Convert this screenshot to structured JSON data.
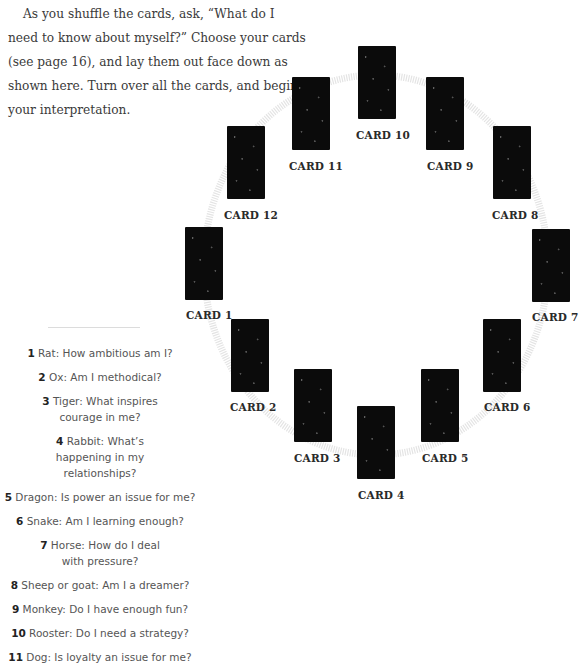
{
  "intro": {
    "text": "As you shuffle the cards, ask, “What do I need to know about myself?” Choose your cards (see page 16), and lay them out face down as shown here. Turn over all the cards, and begin your interpretation."
  },
  "spread": {
    "cards": [
      {
        "label": "CARD 1",
        "x": 185,
        "y": 227,
        "lx": 186,
        "ly": 309
      },
      {
        "label": "CARD 2",
        "x": 231,
        "y": 319,
        "lx": 230,
        "ly": 401
      },
      {
        "label": "CARD 3",
        "x": 294,
        "y": 369,
        "lx": 294,
        "ly": 452
      },
      {
        "label": "CARD 4",
        "x": 357,
        "y": 406,
        "lx": 358,
        "ly": 489
      },
      {
        "label": "CARD 5",
        "x": 421,
        "y": 369,
        "lx": 422,
        "ly": 452
      },
      {
        "label": "CARD 6",
        "x": 483,
        "y": 319,
        "lx": 484,
        "ly": 401
      },
      {
        "label": "CARD 7",
        "x": 532,
        "y": 229,
        "lx": 532,
        "ly": 311
      },
      {
        "label": "CARD 8",
        "x": 493,
        "y": 126,
        "lx": 492,
        "ly": 209
      },
      {
        "label": "CARD 9",
        "x": 426,
        "y": 77,
        "lx": 427,
        "ly": 160
      },
      {
        "label": "CARD 10",
        "x": 358,
        "y": 46,
        "lx": 356,
        "ly": 129
      },
      {
        "label": "CARD 11",
        "x": 292,
        "y": 77,
        "lx": 289,
        "ly": 160
      },
      {
        "label": "CARD 12",
        "x": 227,
        "y": 126,
        "lx": 224,
        "ly": 209
      }
    ]
  },
  "questions": [
    {
      "num": "1",
      "text": "Rat: How ambitious am I?"
    },
    {
      "num": "2",
      "text": "Ox: Am I methodical?"
    },
    {
      "num": "3",
      "text": "Tiger: What inspires courage in me?"
    },
    {
      "num": "4",
      "text": "Rabbit: What’s happening in my relationships?"
    },
    {
      "num": "5",
      "text": "Dragon: Is power an issue for me?"
    },
    {
      "num": "6",
      "text": "Snake: Am I learning enough?"
    },
    {
      "num": "7",
      "text": "Horse: How do I deal with pressure?"
    },
    {
      "num": "8",
      "text": "Sheep or goat: Am I a dreamer?"
    },
    {
      "num": "9",
      "text": "Monkey: Do I have enough fun?"
    },
    {
      "num": "10",
      "text": "Rooster: Do I need a strategy?"
    },
    {
      "num": "11",
      "text": "Dog: Is loyalty an issue for me?"
    }
  ],
  "colors": {
    "card": "#0b0b0b",
    "ring": "#e4e4e4",
    "text": "#3a3a3a"
  }
}
